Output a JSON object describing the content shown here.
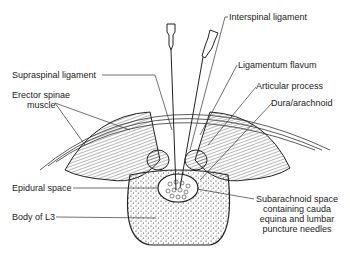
{
  "diagram": {
    "labels": {
      "interspinal_ligament": "Interspinal ligament",
      "supraspinal_ligament": "Supraspinal ligament",
      "ligamentum_flavum": "Ligamentum flavum",
      "articular_process": "Articular process",
      "erector_spinae_line1": "Erector spinae",
      "erector_spinae_line2": "muscle",
      "dura_arachnoid": "Dura/arachnoid",
      "epidural_space": "Epidural space",
      "subarachnoid_line1": "Subarachnoid space",
      "subarachnoid_line2": "containing cauda",
      "subarachnoid_line3": "equina and lumbar",
      "subarachnoid_line4": "puncture needles",
      "body_of_l3": "Body of L3"
    },
    "colors": {
      "ink": "#222222",
      "background": "#ffffff"
    }
  }
}
